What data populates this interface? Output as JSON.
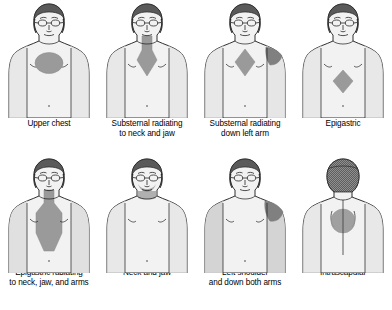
{
  "colors": {
    "background": "#ffffff",
    "body_fill": "#f2f2f2",
    "body_shadow": "#e0e0e0",
    "outline": "#1a1a1a",
    "pain_region": "#9a9a9a",
    "pain_region_dark": "#808080",
    "hair": "#5a5a5a",
    "caption_text": "#000000"
  },
  "panels": [
    {
      "id": "upper-chest",
      "view": "anterior",
      "caption_line1": "Upper chest",
      "caption_line2": "",
      "pain_shape": "oval",
      "pain_location": "upper chest / mid sternum"
    },
    {
      "id": "substernal-neck-jaw",
      "view": "anterior",
      "caption_line1": "Substernal radiating",
      "caption_line2": "to neck and jaw",
      "pain_shape": "neck-band-with-sternal-diamond",
      "pain_location": "neck and substernal"
    },
    {
      "id": "substernal-left-arm",
      "view": "anterior",
      "caption_line1": "Substernal radiating",
      "caption_line2": "down left arm",
      "pain_shape": "sternal-diamond-plus-left-shoulder",
      "pain_location": "substernal and left shoulder down left arm"
    },
    {
      "id": "epigastric",
      "view": "anterior",
      "caption_line1": "Epigastric",
      "caption_line2": "",
      "pain_shape": "diamond",
      "pain_location": "epigastrium"
    },
    {
      "id": "epigastric-neck-jaw-arms",
      "view": "anterior",
      "caption_line1": "Epigastric radiating",
      "caption_line2": "to neck, jaw, and arms",
      "pain_shape": "neck-to-epigastrium-band",
      "pain_location": "neck through sternum to epigastrium, both arms"
    },
    {
      "id": "neck-and-jaw",
      "view": "anterior",
      "caption_line1": "Neck and jaw",
      "caption_line2": "",
      "pain_shape": "jaw-and-neck",
      "pain_location": "jaw and neck"
    },
    {
      "id": "left-shoulder-both-arms",
      "view": "anterior",
      "caption_line1": "Left shoulder",
      "caption_line2": "and down both arms",
      "pain_shape": "left-shoulder-patch",
      "pain_location": "left shoulder, both arms"
    },
    {
      "id": "intrascapular",
      "view": "posterior",
      "caption_line1": "Intrascapular",
      "caption_line2": "",
      "pain_shape": "circle",
      "pain_location": "between scapulae"
    }
  ]
}
